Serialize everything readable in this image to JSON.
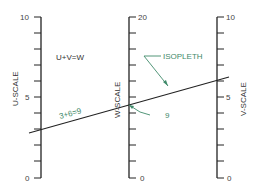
{
  "diagram": {
    "type": "nomogram",
    "equation": "U+V=W",
    "example_label": "3+6=9",
    "isopleth_label": "ISOPLETH",
    "result_label": "9",
    "colors": {
      "axis": "#222222",
      "isopleth": "#222222",
      "annotation": "#3f8a6a"
    },
    "scales": [
      {
        "name": "U-SCALE",
        "min": 0,
        "max": 10,
        "tick_step": 1,
        "labels": [
          "0",
          "5",
          "10"
        ]
      },
      {
        "name": "W-SCALE",
        "min": 0,
        "max": 20,
        "tick_step": 2,
        "labels": [
          "0",
          "20"
        ]
      },
      {
        "name": "V-SCALE",
        "min": 0,
        "max": 10,
        "tick_step": 1,
        "labels": [
          "0",
          "5",
          "10"
        ]
      }
    ],
    "isopleth": {
      "u": 3,
      "v": 6,
      "w": 9
    }
  }
}
